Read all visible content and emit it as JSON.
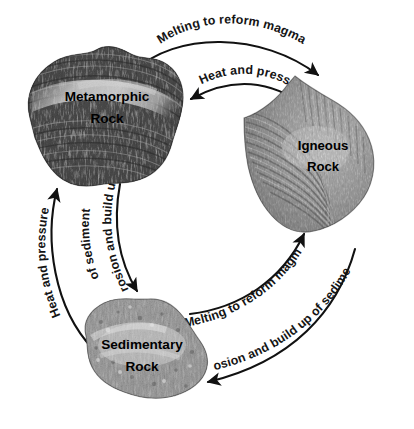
{
  "diagram": {
    "background_color": "#ffffff",
    "ink_color": "#111111",
    "width": 414,
    "height": 429
  },
  "nodes": [
    {
      "id": "metamorphic",
      "label_line1": "Metamorphic",
      "label_line2": "Rock",
      "position": "top-left",
      "tone": "dark",
      "texture": "foliated banded"
    },
    {
      "id": "igneous",
      "label_line1": "Igneous",
      "label_line2": "Rock",
      "position": "right",
      "tone": "medium",
      "texture": "concentric fan bands"
    },
    {
      "id": "sedimentary",
      "label_line1": "Sedimentary",
      "label_line2": "Rock",
      "position": "bottom-left",
      "tone": "medium-light",
      "texture": "speckled grains"
    }
  ],
  "arrows": [
    {
      "id": "metamorphic-to-igneous",
      "label": "Melting to reform magma",
      "from": "metamorphic",
      "to": "igneous",
      "side": "top-outer"
    },
    {
      "id": "igneous-to-metamorphic",
      "label": "Heat and pressure",
      "from": "igneous",
      "to": "metamorphic",
      "side": "top-inner"
    },
    {
      "id": "metamorphic-to-sedimentary",
      "label_line1": "Erosion and build up",
      "label_line2": "of sediment",
      "from": "metamorphic",
      "to": "sedimentary",
      "side": "left-inner"
    },
    {
      "id": "sedimentary-to-metamorphic",
      "label": "Heat and pressure",
      "from": "sedimentary",
      "to": "metamorphic",
      "side": "left-outer"
    },
    {
      "id": "sedimentary-to-igneous",
      "label": "Melting to reform magma",
      "from": "sedimentary",
      "to": "igneous",
      "side": "bottom-inner"
    },
    {
      "id": "igneous-to-sedimentary",
      "label": "Erosion and build up of sediment",
      "from": "igneous",
      "to": "sedimentary",
      "side": "bottom-outer"
    }
  ]
}
